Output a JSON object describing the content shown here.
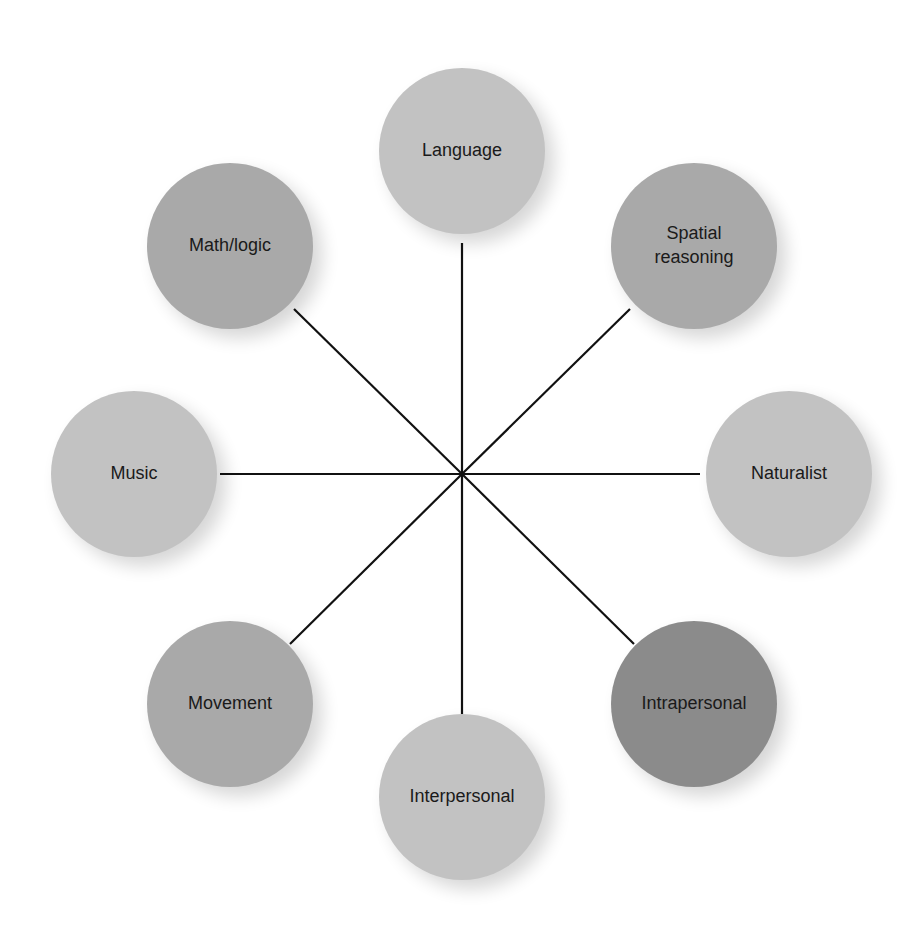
{
  "diagram": {
    "type": "hub-and-spoke",
    "hub": {
      "x": 462,
      "y": 474
    },
    "node_radius": 83,
    "colors": {
      "light": "#c2c2c2",
      "medium": "#a9a9a9",
      "dark": "#8b8b8b",
      "line": "#111111"
    },
    "nodes": [
      {
        "id": "language",
        "label_lines": [
          "Language"
        ],
        "cx": 462,
        "cy": 151,
        "shade": "light",
        "line_end": {
          "x": 462,
          "y": 243
        }
      },
      {
        "id": "spatial-reasoning",
        "label_lines": [
          "Spatial",
          "reasoning"
        ],
        "cx": 694,
        "cy": 246,
        "shade": "medium",
        "line_end": {
          "x": 630,
          "y": 309
        }
      },
      {
        "id": "naturalist",
        "label_lines": [
          "Naturalist"
        ],
        "cx": 789,
        "cy": 474,
        "shade": "light",
        "line_end": {
          "x": 700,
          "y": 474
        }
      },
      {
        "id": "intrapersonal",
        "label_lines": [
          "Intrapersonal"
        ],
        "cx": 694,
        "cy": 704,
        "shade": "dark",
        "line_end": {
          "x": 634,
          "y": 644
        }
      },
      {
        "id": "interpersonal",
        "label_lines": [
          "Interpersonal"
        ],
        "cx": 462,
        "cy": 797,
        "shade": "light",
        "line_end": {
          "x": 462,
          "y": 714
        }
      },
      {
        "id": "movement",
        "label_lines": [
          "Movement"
        ],
        "cx": 230,
        "cy": 704,
        "shade": "medium",
        "line_end": {
          "x": 290,
          "y": 644
        }
      },
      {
        "id": "music",
        "label_lines": [
          "Music"
        ],
        "cx": 134,
        "cy": 474,
        "shade": "light",
        "line_end": {
          "x": 220,
          "y": 474
        }
      },
      {
        "id": "math-logic",
        "label_lines": [
          "Math/logic"
        ],
        "cx": 230,
        "cy": 246,
        "shade": "medium",
        "line_end": {
          "x": 294,
          "y": 309
        }
      }
    ]
  }
}
